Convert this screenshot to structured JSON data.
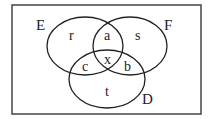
{
  "diagram": {
    "type": "venn",
    "colors": {
      "stroke": "#222222",
      "background": "#ffffff",
      "frame": "#444444"
    },
    "sets": [
      {
        "id": "E",
        "label": "E"
      },
      {
        "id": "F",
        "label": "F"
      },
      {
        "id": "D",
        "label": "D"
      }
    ],
    "regions": {
      "E_only": "r",
      "E_and_F_only": "a",
      "F_only": "s",
      "E_and_D_only": "c",
      "E_and_F_and_D": "x",
      "F_and_D_only": "b",
      "D_only": "t"
    }
  }
}
